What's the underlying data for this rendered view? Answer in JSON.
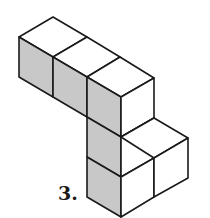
{
  "figure": {
    "label": "3.",
    "colors": {
      "line": "#1a1a1a",
      "shaded_face": "#c8c8c8",
      "light_face": "#ffffff"
    }
  }
}
